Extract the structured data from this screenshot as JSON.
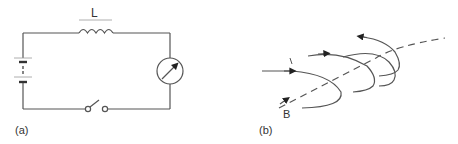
{
  "figure": {
    "panel_a": {
      "label": "(a)",
      "inductor_label": "L",
      "components": [
        "battery",
        "inductor",
        "meter",
        "switch"
      ]
    },
    "panel_b": {
      "label": "(b)",
      "field_label": "B"
    }
  },
  "colors": {
    "line": "#555555",
    "text": "#333333",
    "background": "#ffffff"
  }
}
